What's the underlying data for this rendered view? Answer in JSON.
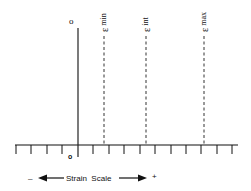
{
  "diagram": {
    "origin_top_label": "o",
    "origin_bottom_label": "o",
    "markers": [
      {
        "symbol": "ε",
        "subscript": "min",
        "x": 104
      },
      {
        "symbol": "ε",
        "subscript": "int",
        "x": 146
      },
      {
        "symbol": "ε",
        "subscript": "max",
        "x": 204
      }
    ],
    "scale": {
      "minus_label": "–",
      "label": "Strain  Scale",
      "plus_label": "+"
    },
    "colors": {
      "line": "#111111",
      "background": "#ffffff"
    }
  }
}
